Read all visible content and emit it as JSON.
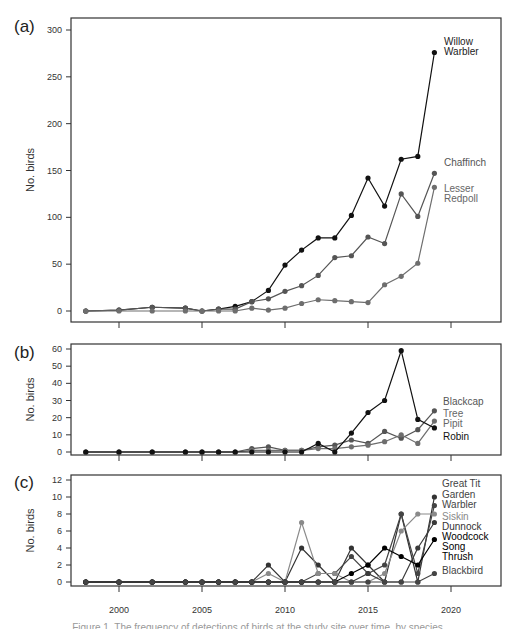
{
  "figure": {
    "x_ticks": [
      "2000",
      "2005",
      "2010",
      "2015",
      "2020"
    ],
    "caption_partial": "Figure 1. The frequency of detections of birds at the study site over time, by species"
  },
  "chart_data": [
    {
      "panel": "(a)",
      "type": "line",
      "ylabel": "No. birds",
      "xlabel": "",
      "ylim": [
        0,
        300
      ],
      "yticks": [
        0,
        50,
        100,
        150,
        200,
        250,
        300
      ],
      "x": [
        1998,
        2000,
        2002,
        2004,
        2005,
        2006,
        2007,
        2008,
        2009,
        2010,
        2011,
        2012,
        2013,
        2014,
        2015,
        2016,
        2017,
        2018,
        2019
      ],
      "series": [
        {
          "name": "Willow Warbler",
          "color": "#111111",
          "values": [
            0,
            1,
            4,
            3,
            0,
            2,
            5,
            10,
            22,
            49,
            65,
            78,
            78,
            102,
            142,
            112,
            162,
            165,
            276
          ]
        },
        {
          "name": "Chaffinch",
          "color": "#555555",
          "values": [
            0,
            1,
            4,
            3,
            0,
            2,
            2,
            10,
            13,
            21,
            27,
            38,
            57,
            59,
            79,
            72,
            125,
            101,
            147
          ]
        },
        {
          "name": "Lesser Redpoll",
          "color": "#6e6e6e",
          "values": [
            0,
            0,
            0,
            0,
            0,
            0,
            0,
            3,
            1,
            3,
            8,
            12,
            11,
            10,
            9,
            28,
            37,
            51,
            132
          ]
        }
      ],
      "legend_position": "right, inline at series end"
    },
    {
      "panel": "(b)",
      "type": "line",
      "ylabel": "No. birds",
      "ylim": [
        0,
        60
      ],
      "yticks": [
        0,
        10,
        20,
        30,
        40,
        50,
        60
      ],
      "x": [
        1998,
        2000,
        2002,
        2004,
        2005,
        2006,
        2007,
        2008,
        2009,
        2010,
        2011,
        2012,
        2013,
        2014,
        2015,
        2016,
        2017,
        2018,
        2019
      ],
      "series": [
        {
          "name": "Blackcap",
          "color": "#555555",
          "values": [
            0,
            0,
            0,
            0,
            0,
            0,
            0,
            2,
            3,
            1,
            1,
            3,
            4,
            7,
            5,
            12,
            8,
            13,
            24
          ]
        },
        {
          "name": "Tree Pipit",
          "color": "#6e6e6e",
          "values": [
            0,
            0,
            0,
            0,
            0,
            0,
            0,
            1,
            1,
            1,
            1,
            2,
            2,
            3,
            4,
            6,
            10,
            5,
            18
          ]
        },
        {
          "name": "Robin",
          "color": "#111111",
          "values": [
            0,
            0,
            0,
            0,
            0,
            0,
            0,
            0,
            0,
            0,
            0,
            5,
            0,
            11,
            23,
            30,
            59,
            19,
            14
          ]
        }
      ],
      "legend_position": "right, inline at series end"
    },
    {
      "panel": "(c)",
      "type": "line",
      "ylabel": "No. birds",
      "xlabel": "",
      "ylim": [
        0,
        12
      ],
      "yticks": [
        0,
        2,
        4,
        6,
        8,
        10,
        12
      ],
      "xticks": [
        2000,
        2005,
        2010,
        2015,
        2020
      ],
      "x": [
        1998,
        2000,
        2002,
        2004,
        2005,
        2006,
        2007,
        2008,
        2009,
        2010,
        2011,
        2012,
        2013,
        2014,
        2015,
        2016,
        2017,
        2018,
        2019
      ],
      "series": [
        {
          "name": "Great Tit",
          "color": "#333333",
          "values": [
            0,
            0,
            0,
            0,
            0,
            0,
            0,
            0,
            2,
            0,
            4,
            2,
            0,
            4,
            2,
            0,
            8,
            0,
            10
          ]
        },
        {
          "name": "Garden Warbler",
          "color": "#444444",
          "values": [
            0,
            0,
            0,
            0,
            0,
            0,
            0,
            0,
            0,
            0,
            0,
            1,
            1,
            3,
            1,
            2,
            8,
            1,
            9
          ]
        },
        {
          "name": "Siskin",
          "color": "#8a8a8a",
          "values": [
            0,
            0,
            0,
            0,
            0,
            0,
            0,
            0,
            1,
            0,
            7,
            1,
            1,
            0,
            0,
            1,
            6,
            8,
            8
          ]
        },
        {
          "name": "Dunnock",
          "color": "#3a3a3a",
          "values": [
            0,
            0,
            0,
            0,
            0,
            0,
            0,
            0,
            0,
            0,
            0,
            0,
            0,
            0,
            1,
            0,
            0,
            4,
            7
          ]
        },
        {
          "name": "Woodcock Song Thrush",
          "color": "#000000",
          "values": [
            0,
            0,
            0,
            0,
            0,
            0,
            0,
            0,
            0,
            0,
            0,
            0,
            0,
            1,
            2,
            4,
            3,
            2,
            5
          ]
        },
        {
          "name": "Blackbird",
          "color": "#444444",
          "values": [
            0,
            0,
            0,
            0,
            0,
            0,
            0,
            0,
            0,
            0,
            0,
            0,
            0,
            0,
            0,
            0,
            0,
            0,
            1
          ]
        }
      ],
      "legend_position": "right, inline at series end"
    }
  ]
}
